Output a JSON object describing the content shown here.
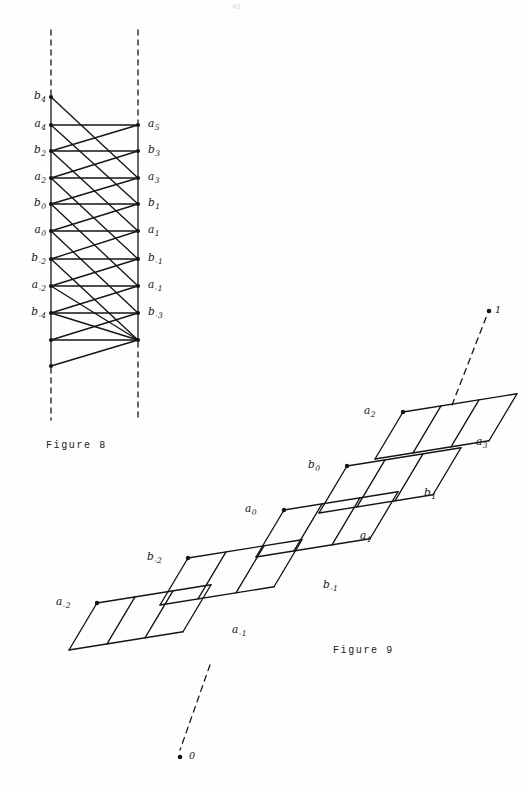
{
  "page": {
    "page_number": "45",
    "background_color": "#fefefe",
    "ink_color": "#151515"
  },
  "figure8": {
    "caption": "Figure 8",
    "description": "Two vertical dashed rails with node columns joined by horizontal and diagonal segments",
    "geometry": {
      "left_rail_x": 51,
      "right_rail_x": 138,
      "dash_top_y": 30,
      "dash_bottom_y": 420,
      "node_spacing_y": 25.6
    },
    "left_nodes": [
      {
        "label": "b",
        "sub": "4",
        "x": 51,
        "y": 97,
        "show_label": true
      },
      {
        "label": "a",
        "sub": "4",
        "x": 51,
        "y": 125,
        "show_label": true
      },
      {
        "label": "b",
        "sub": "2",
        "x": 51,
        "y": 151,
        "show_label": true
      },
      {
        "label": "a",
        "sub": "2",
        "x": 51,
        "y": 178,
        "show_label": true
      },
      {
        "label": "b",
        "sub": "0",
        "x": 51,
        "y": 204,
        "show_label": true
      },
      {
        "label": "a",
        "sub": "0",
        "x": 51,
        "y": 231,
        "show_label": true
      },
      {
        "label": "b",
        "sub": "-2",
        "x": 51,
        "y": 259,
        "show_label": true
      },
      {
        "label": "a",
        "sub": "-2",
        "x": 51,
        "y": 286,
        "show_label": true
      },
      {
        "label": "b",
        "sub": "-4",
        "x": 51,
        "y": 313,
        "show_label": true
      },
      {
        "label": "",
        "sub": "",
        "x": 51,
        "y": 340,
        "show_label": false
      },
      {
        "label": "",
        "sub": "",
        "x": 51,
        "y": 366,
        "show_label": false
      }
    ],
    "right_nodes": [
      {
        "label": "a",
        "sub": "5",
        "x": 138,
        "y": 125,
        "show_label": true
      },
      {
        "label": "b",
        "sub": "3",
        "x": 138,
        "y": 151,
        "show_label": true
      },
      {
        "label": "a",
        "sub": "3",
        "x": 138,
        "y": 178,
        "show_label": true
      },
      {
        "label": "b",
        "sub": "1",
        "x": 138,
        "y": 204,
        "show_label": true
      },
      {
        "label": "a",
        "sub": "1",
        "x": 138,
        "y": 231,
        "show_label": true
      },
      {
        "label": "b",
        "sub": "-1",
        "x": 138,
        "y": 259,
        "show_label": true
      },
      {
        "label": "a",
        "sub": "-1",
        "x": 138,
        "y": 286,
        "show_label": true
      },
      {
        "label": "b",
        "sub": "-3",
        "x": 138,
        "y": 313,
        "show_label": true
      },
      {
        "label": "",
        "sub": "",
        "x": 138,
        "y": 340,
        "show_label": false
      }
    ],
    "left_label_x": 22,
    "right_label_x": 148,
    "caption_x": 46,
    "caption_y": 440
  },
  "figure9": {
    "caption": "Figure 9",
    "description": "Staircase of four overlapping bands, each three parallelogram cells wide, ascending to the right",
    "caption_x": 333,
    "caption_y": 645,
    "bands": [
      {
        "name": "band-lowest",
        "origin_x": 97,
        "origin_y": 603,
        "start_label": {
          "label": "a",
          "sub": "-2",
          "x": 56,
          "y": 596
        },
        "end_label": {
          "label": "a",
          "sub": "-1",
          "x": 232,
          "y": 624
        }
      },
      {
        "name": "band-lower",
        "origin_x": 188,
        "origin_y": 558,
        "start_label": {
          "label": "b",
          "sub": "-2",
          "x": 147,
          "y": 551
        },
        "end_label": {
          "label": "b",
          "sub": "-1",
          "x": 323,
          "y": 579
        }
      },
      {
        "name": "band-upper",
        "origin_x": 284,
        "origin_y": 510,
        "start_label": {
          "label": "a",
          "sub": "0",
          "x": 245,
          "y": 503
        },
        "end_label": {
          "label": "a",
          "sub": "1",
          "x": 360,
          "y": 530
        }
      },
      {
        "name": "band-upper-mid",
        "origin_x": 347,
        "origin_y": 466,
        "start_label": {
          "label": "b",
          "sub": "0",
          "x": 308,
          "y": 459
        },
        "end_label": {
          "label": "b",
          "sub": "1",
          "x": 424,
          "y": 487
        }
      },
      {
        "name": "band-highest",
        "origin_x": 403,
        "origin_y": 412,
        "start_label": {
          "label": "a",
          "sub": "2",
          "x": 364,
          "y": 405
        },
        "end_label": {
          "label": "a",
          "sub": "3",
          "x": 476,
          "y": 436
        }
      }
    ],
    "cell": {
      "width": 38,
      "skew_dx": 28,
      "skew_dy": 47
    },
    "dashed_rays": [
      {
        "name": "upper-ray",
        "x1": 452,
        "y1": 405,
        "x2": 487,
        "y2": 315,
        "endpoint": {
          "x": 489,
          "y": 311,
          "label": "1",
          "label_x": 495,
          "label_y": 304
        }
      },
      {
        "name": "lower-ray",
        "x1": 210,
        "y1": 665,
        "x2": 180,
        "y2": 750,
        "endpoint": {
          "x": 180,
          "y": 757,
          "label": "0",
          "label_x": 189,
          "label_y": 750
        }
      }
    ]
  }
}
